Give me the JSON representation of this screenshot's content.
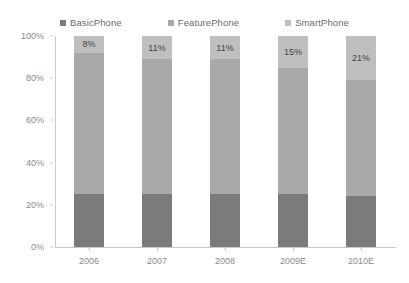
{
  "chart_data": {
    "type": "bar",
    "subtype": "stacked-100-percent",
    "title": "",
    "xlabel": "",
    "ylabel": "",
    "categories": [
      "2006",
      "2007",
      "2008",
      "2009E",
      "2010E"
    ],
    "series": [
      {
        "name": "BasicPhone",
        "color": "#7b7b7b",
        "values": [
          25,
          25,
          25,
          25,
          24
        ]
      },
      {
        "name": "FeaturePhone",
        "color": "#a9a9a9",
        "values": [
          67,
          64,
          64,
          60,
          55
        ]
      },
      {
        "name": "SmartPhone",
        "color": "#bfbfbf",
        "values": [
          8,
          11,
          11,
          15,
          21
        ]
      }
    ],
    "data_labels": {
      "series": "SmartPhone",
      "values": [
        "8%",
        "11%",
        "11%",
        "15%",
        "21%"
      ]
    },
    "ylim": [
      0,
      100
    ],
    "y_ticks": [
      0,
      20,
      40,
      60,
      80,
      100
    ],
    "y_tick_labels": [
      "0%",
      "20%",
      "40%",
      "60%",
      "80%",
      "100%"
    ],
    "grid": false,
    "legend_position": "top"
  },
  "legend": {
    "items": [
      {
        "label": "BasicPhone",
        "color": "#7b7b7b"
      },
      {
        "label": "FeaturePhone",
        "color": "#a9a9a9"
      },
      {
        "label": "SmartPhone",
        "color": "#bfbfbf"
      }
    ]
  },
  "axis": {
    "y_labels": [
      "100%",
      "80%",
      "60%",
      "40%",
      "20%",
      "0%"
    ],
    "x_labels": [
      "2006",
      "2007",
      "2008",
      "2009E",
      "2010E"
    ]
  },
  "colors": {
    "basic_phone": "#7b7b7b",
    "feature_phone": "#a9a9a9",
    "smart_phone": "#bfbfbf",
    "axis_line": "#c9c9c9",
    "tick_text": "#8a8a8a",
    "legend_text": "#6a6a6a",
    "label_text": "#444444",
    "background": "#ffffff"
  }
}
